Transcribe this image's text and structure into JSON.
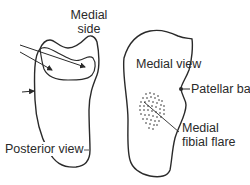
{
  "labels": {
    "medial_side_line1": "Medial",
    "medial_side_line2": "side",
    "medial_view": "Medial view",
    "patellar_bar": "Patellar bar",
    "posterior_view": "Posterior view",
    "medial_flare_line1": "Medial",
    "medial_flare_line2": "fibial flare"
  },
  "colors": {
    "stroke": "#2a2a2a",
    "background": "#ffffff"
  }
}
